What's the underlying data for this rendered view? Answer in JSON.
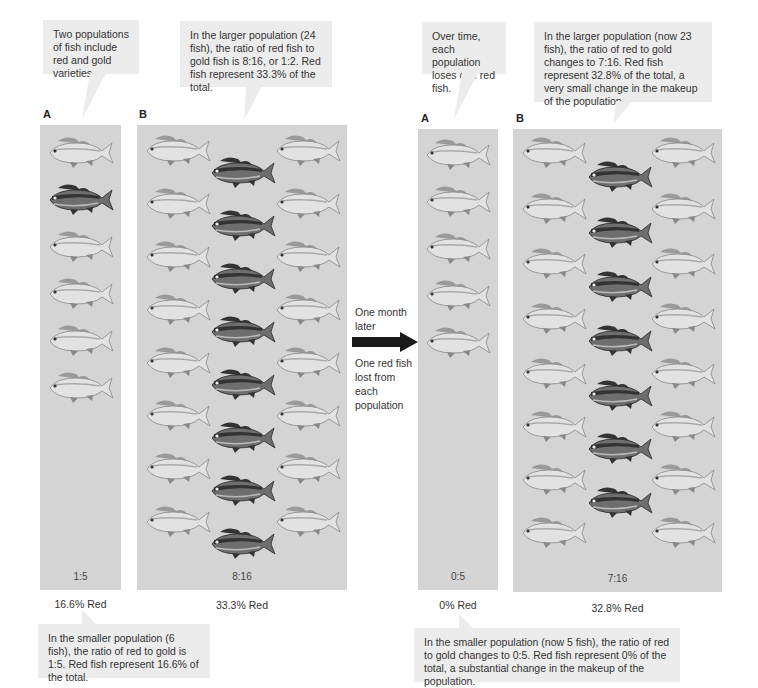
{
  "before": {
    "callout_intro": "Two populations of fish include red and gold varieties.",
    "callout_large": "In the larger population (24 fish), the ratio of red fish to gold fish is 8:16, or 1:2. Red fish represent 33.3% of the total.",
    "callout_small": "In the smaller population (6 fish), the ratio of red to gold is 1:5. Red fish represent 16.6% of the total.",
    "panel_a": {
      "letter": "A",
      "ratio": "1:5",
      "percent": "16.6% Red"
    },
    "panel_b": {
      "letter": "B",
      "ratio": "8:16",
      "percent": "33.3% Red"
    }
  },
  "transition": {
    "top_text": "One month later",
    "bottom_text": "One red fish lost from each population"
  },
  "after": {
    "callout_intro": "Over time, each population loses one red fish.",
    "callout_large": "In the larger population (now 23 fish), the ratio of red to gold changes to 7:16. Red fish represent 32.8% of the total, a very small change in the makeup of the population.",
    "callout_small": "In the smaller population (now 5 fish), the ratio of red to gold changes to 0:5. Red fish represent 0% of the total, a substantial change in the makeup of the population.",
    "panel_a": {
      "letter": "A",
      "ratio": "0:5",
      "percent": "0% Red"
    },
    "panel_b": {
      "letter": "B",
      "ratio": "7:16",
      "percent": "32.8% Red"
    }
  },
  "colors": {
    "panel_bg": "#d4d4d4",
    "callout_bg": "#ececec",
    "red_fish": "#3a3a3a",
    "gold_fish": "#bdbdbd",
    "arrow": "#1a1a1a"
  }
}
